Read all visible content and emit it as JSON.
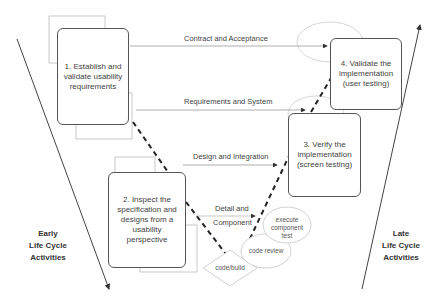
{
  "diagram": {
    "type": "V-model usability life cycle",
    "boxes": [
      {
        "id": 1,
        "label": "1. Establish and validate usability requirements"
      },
      {
        "id": 2,
        "label": "2. Inspect the specification and designs from a usability perspective"
      },
      {
        "id": 3,
        "label": "3. Verify the implementation (screen testing)"
      },
      {
        "id": 4,
        "label": "4. Validate the implementation (user testing)"
      }
    ],
    "connectors": [
      {
        "label": "Contract and Acceptance"
      },
      {
        "label": "Requirements and System"
      },
      {
        "label": "Design and Integration"
      },
      {
        "label_line1": "Detail and",
        "label_line2": "Component"
      }
    ],
    "activities": {
      "code_build": "code/build",
      "code_review": "code review",
      "execute_test": "execute component test"
    },
    "side_labels": {
      "early": [
        "Early",
        "Life Cycle",
        "Activities"
      ],
      "late": [
        "Late",
        "Life Cycle",
        "Activities"
      ]
    },
    "colors": {
      "line": "#555555",
      "light_line": "#bbbbbb",
      "text": "#444444"
    }
  }
}
